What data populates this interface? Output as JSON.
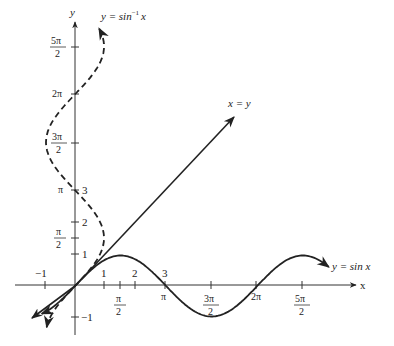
{
  "figure": {
    "axes": {
      "x_label": "x",
      "y_label": "y",
      "x_ticks_numeric": [
        {
          "label": "−1",
          "value": -1
        },
        {
          "label": "1",
          "value": 1
        },
        {
          "label": "2",
          "value": 2
        },
        {
          "label": "3",
          "value": 3
        }
      ],
      "x_ticks_pi": [
        {
          "num": "π",
          "den": "2",
          "value": 1.5708
        },
        {
          "num": "π",
          "den": "",
          "value": 3.1416
        },
        {
          "num": "3π",
          "den": "2",
          "value": 4.7124
        },
        {
          "num": "2π",
          "den": "",
          "value": 6.2832
        },
        {
          "num": "5π",
          "den": "2",
          "value": 7.854
        }
      ],
      "y_ticks_numeric": [
        {
          "label": "1",
          "value": 1
        },
        {
          "label": "2",
          "value": 2
        },
        {
          "label": "3",
          "value": 3
        },
        {
          "label": "−1",
          "value": -1
        }
      ],
      "y_ticks_pi": [
        {
          "num": "π",
          "den": "2",
          "value": 1.5708
        },
        {
          "num": "π",
          "den": "",
          "value": 3.1416
        },
        {
          "num": "3π",
          "den": "2",
          "value": 4.7124
        },
        {
          "num": "2π",
          "den": "",
          "value": 6.2832
        },
        {
          "num": "5π",
          "den": "2",
          "value": 7.854
        }
      ]
    },
    "curves": {
      "sin": {
        "label": "y = sin x",
        "style": "solid"
      },
      "arcsin": {
        "label": "y = sin⁻¹ x",
        "style": "dashed"
      },
      "identity": {
        "label": "x = y",
        "style": "solid"
      }
    },
    "labels": {
      "sin_label": "y = sin x",
      "arcsin_label_main": "y = sin",
      "arcsin_label_sup": "−1",
      "arcsin_label_var": "x",
      "identity_label": "x = y",
      "x_axis": "x",
      "y_axis": "y",
      "tick_neg1_x": "−1",
      "tick_1_x": "1",
      "tick_2_x": "2",
      "tick_3_x": "3",
      "tick_pi_x": "π",
      "tick_pi2_x_num": "π",
      "tick_pi2_x_den": "2",
      "tick_3pi2_x_num": "3π",
      "tick_3pi2_x_den": "2",
      "tick_2pi_x": "2π",
      "tick_5pi2_x_num": "5π",
      "tick_5pi2_x_den": "2",
      "tick_1_y": "1",
      "tick_2_y": "2",
      "tick_3_y": "3",
      "tick_neg1_y": "−1",
      "tick_pi_y": "π",
      "tick_pi2_y_num": "π",
      "tick_pi2_y_den": "2",
      "tick_3pi2_y_num": "3π",
      "tick_3pi2_y_den": "2",
      "tick_2pi_y": "2π",
      "tick_5pi2_y_num": "5π",
      "tick_5pi2_y_den": "2"
    }
  }
}
